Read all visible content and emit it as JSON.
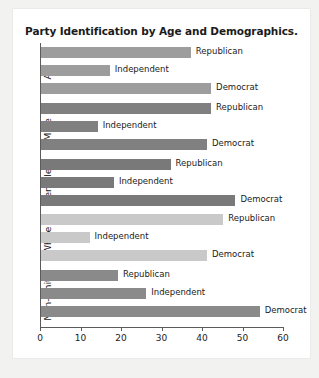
{
  "chart_data": {
    "type": "bar",
    "orientation": "horizontal",
    "title": "Party Identification by Age and Demographics.",
    "xlabel": "",
    "ylabel": "",
    "xlim": [
      0,
      60
    ],
    "xticks": [
      0,
      10,
      20,
      30,
      40,
      50,
      60
    ],
    "xtick_labels": [
      "0",
      "10",
      "20",
      "30",
      "40",
      "50",
      "60"
    ],
    "grid": false,
    "legend": "none",
    "categories": [
      "All",
      "Male",
      "Female",
      "White",
      "Non-white"
    ],
    "series": [
      {
        "name": "Republican",
        "values": [
          37,
          42,
          32,
          45,
          19
        ]
      },
      {
        "name": "Independent",
        "values": [
          17,
          14,
          18,
          12,
          26
        ]
      },
      {
        "name": "Democrat",
        "values": [
          42,
          41,
          48,
          41,
          54
        ]
      }
    ],
    "group_colors": {
      "All": "#9d9d9d",
      "Male": "#808080",
      "Female": "#797979",
      "White": "#c9c9c9",
      "Non-white": "#8a8a8a"
    }
  },
  "chart": {
    "title": "Party Identification by Age and Demographics.",
    "axis": {
      "ticks": [
        {
          "label": "0",
          "value": 0
        },
        {
          "label": "10",
          "value": 10
        },
        {
          "label": "20",
          "value": 20
        },
        {
          "label": "30",
          "value": 30
        },
        {
          "label": "40",
          "value": 40
        },
        {
          "label": "50",
          "value": 50
        },
        {
          "label": "60",
          "value": 60
        }
      ]
    },
    "groups": [
      {
        "label": "All",
        "color": "#9d9d9d",
        "bars": [
          {
            "label": "Republican",
            "value": 37
          },
          {
            "label": "Independent",
            "value": 17
          },
          {
            "label": "Democrat",
            "value": 42
          }
        ]
      },
      {
        "label": "Male",
        "color": "#808080",
        "bars": [
          {
            "label": "Republican",
            "value": 42
          },
          {
            "label": "Independent",
            "value": 14
          },
          {
            "label": "Democrat",
            "value": 41
          }
        ]
      },
      {
        "label": "Female",
        "color": "#797979",
        "bars": [
          {
            "label": "Republican",
            "value": 32
          },
          {
            "label": "Independent",
            "value": 18
          },
          {
            "label": "Democrat",
            "value": 48
          }
        ]
      },
      {
        "label": "White",
        "color": "#c9c9c9",
        "bars": [
          {
            "label": "Republican",
            "value": 45
          },
          {
            "label": "Independent",
            "value": 12
          },
          {
            "label": "Democrat",
            "value": 41
          }
        ]
      },
      {
        "label": "Non-white",
        "color": "#8a8a8a",
        "bars": [
          {
            "label": "Republican",
            "value": 19
          },
          {
            "label": "Independent",
            "value": 26
          },
          {
            "label": "Democrat",
            "value": 54
          }
        ]
      }
    ]
  }
}
